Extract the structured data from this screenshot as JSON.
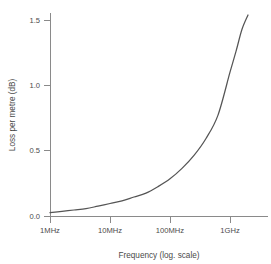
{
  "chart_data": {
    "type": "line",
    "title": "",
    "subtitle": "",
    "xlabel": "Frequency (log. scale)",
    "ylabel": "Loss per metre (dB)",
    "x_scale": "log",
    "y_scale": "linear",
    "grid": false,
    "legend": null,
    "x_tick_labels": [
      "1MHz",
      "10MHz",
      "100MHz",
      "1GHz"
    ],
    "x_tick_values": [
      1000000,
      10000000,
      100000000,
      1000000000
    ],
    "y_tick_labels": [
      "0.0",
      "0.5",
      "1.0",
      "1.5"
    ],
    "y_tick_values": [
      0.0,
      0.5,
      1.0,
      1.5
    ],
    "xlim": [
      1000000,
      1600000000
    ],
    "ylim": [
      0.0,
      1.6
    ],
    "series": [
      {
        "name": "Loss per metre",
        "color": "#555555",
        "x_decades": [
          0.0,
          0.2,
          0.4,
          0.6,
          0.8,
          1.0,
          1.2,
          1.4,
          1.6,
          1.8,
          2.0,
          2.2,
          2.4,
          2.6,
          2.8,
          3.0,
          3.1,
          3.2,
          3.3
        ],
        "x_labels": [
          "1MHz",
          "1.6MHz",
          "2.5MHz",
          "4MHz",
          "6.3MHz",
          "10MHz",
          "16MHz",
          "25MHz",
          "40MHz",
          "63MHz",
          "100MHz",
          "160MHz",
          "250MHz",
          "400MHz",
          "630MHz",
          "1GHz",
          "1.26GHz",
          "1.6GHz",
          "2GHz"
        ],
        "values": [
          0.03,
          0.04,
          0.05,
          0.06,
          0.08,
          0.1,
          0.12,
          0.15,
          0.18,
          0.23,
          0.29,
          0.37,
          0.47,
          0.6,
          0.78,
          1.11,
          1.27,
          1.44,
          1.55
        ]
      }
    ],
    "annotations": []
  },
  "axis": {
    "y_title": "Loss per metre (dB)",
    "x_title": "Frequency (log. scale)"
  },
  "colors": {
    "curve": "#555555",
    "axis": "#8a8a8a",
    "text": "#4a4a4a",
    "background": "#ffffff"
  }
}
